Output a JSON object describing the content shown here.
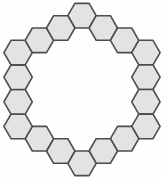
{
  "figure": {
    "background_color": "#fefefe",
    "tile_fill_color": "#e3e3e3",
    "tile_stroke_color": "#4d4d4d",
    "tile_stroke_width": 1.6,
    "hex_orientation": "flat-top",
    "hex_circumradius_px": 14.2,
    "ring_center_px": {
      "x": 82,
      "y": 89.5
    },
    "tile_count": 18,
    "tiles": [
      {
        "id": "hex-top",
        "q": 0,
        "r": -3
      },
      {
        "id": "hex-top-right-1",
        "q": 1,
        "r": -3
      },
      {
        "id": "hex-top-right-2",
        "q": 2,
        "r": -3
      },
      {
        "id": "hex-right-col-1",
        "q": 3,
        "r": -3
      },
      {
        "id": "hex-right-col-2",
        "q": 3,
        "r": -2
      },
      {
        "id": "hex-right-col-3",
        "q": 3,
        "r": -1
      },
      {
        "id": "hex-right-col-4",
        "q": 3,
        "r": 0
      },
      {
        "id": "hex-bottom-right-2",
        "q": 2,
        "r": 1
      },
      {
        "id": "hex-bottom-right-1",
        "q": 1,
        "r": 2
      },
      {
        "id": "hex-bottom",
        "q": 0,
        "r": 3
      },
      {
        "id": "hex-bottom-left-1",
        "q": -1,
        "r": 3
      },
      {
        "id": "hex-bottom-left-2",
        "q": -2,
        "r": 3
      },
      {
        "id": "hex-left-col-4",
        "q": -3,
        "r": 3
      },
      {
        "id": "hex-left-col-3",
        "q": -3,
        "r": 2
      },
      {
        "id": "hex-left-col-2",
        "q": -3,
        "r": 1
      },
      {
        "id": "hex-left-col-1",
        "q": -3,
        "r": 0
      },
      {
        "id": "hex-top-left-2",
        "q": -2,
        "r": -1
      },
      {
        "id": "hex-top-left-1",
        "q": -1,
        "r": -2
      }
    ]
  }
}
